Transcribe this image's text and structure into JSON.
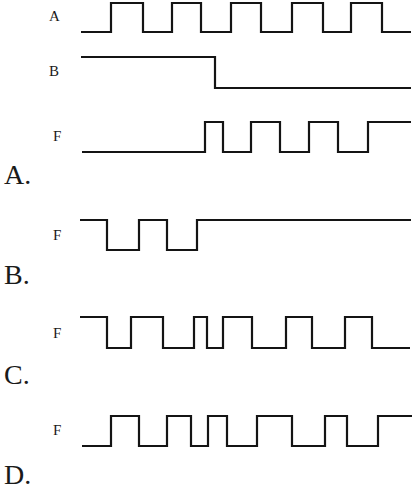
{
  "diagram": {
    "inputs": [
      {
        "label": "A",
        "label_pos": [
          49,
          9
        ],
        "start_x": 81,
        "end_x": 411,
        "high_y": 3,
        "low_y": 32,
        "initial": "low",
        "edges_x": [
          111,
          143,
          172,
          201,
          231,
          261,
          292,
          323,
          351,
          382
        ]
      },
      {
        "label": "B",
        "label_pos": [
          49,
          64
        ],
        "start_x": 81,
        "end_x": 411,
        "high_y": 57,
        "low_y": 88,
        "initial": "high",
        "edges_x": [
          215
        ]
      }
    ],
    "options": [
      {
        "option_label": "A.",
        "option_pos": [
          4,
          161
        ],
        "signal_label": "F",
        "signal_pos": [
          53,
          129
        ],
        "start_x": 82,
        "end_x": 411,
        "high_y": 122,
        "low_y": 152,
        "initial": "low",
        "edges_x": [
          205,
          223,
          251,
          280,
          309,
          338,
          368
        ]
      },
      {
        "option_label": "B.",
        "option_pos": [
          4,
          261
        ],
        "signal_label": "F",
        "signal_pos": [
          53,
          228
        ],
        "start_x": 80,
        "end_x": 411,
        "high_y": 220,
        "low_y": 250,
        "initial": "high",
        "edges_x": [
          107,
          139,
          167,
          197
        ]
      },
      {
        "option_label": "C.",
        "option_pos": [
          4,
          361
        ],
        "signal_label": "F",
        "signal_pos": [
          53,
          326
        ],
        "start_x": 80,
        "end_x": 410,
        "high_y": 317,
        "low_y": 348,
        "initial": "high",
        "edges_x": [
          107,
          131,
          163,
          194,
          207,
          223,
          252,
          286,
          312,
          345,
          372
        ]
      },
      {
        "option_label": "D.",
        "option_pos": [
          4,
          461
        ],
        "signal_label": "F",
        "signal_pos": [
          53,
          423
        ],
        "start_x": 82,
        "end_x": 412,
        "high_y": 416,
        "low_y": 446,
        "initial": "low",
        "edges_x": [
          111,
          139,
          167,
          191,
          208,
          227,
          257,
          292,
          325,
          347,
          378
        ]
      }
    ]
  }
}
